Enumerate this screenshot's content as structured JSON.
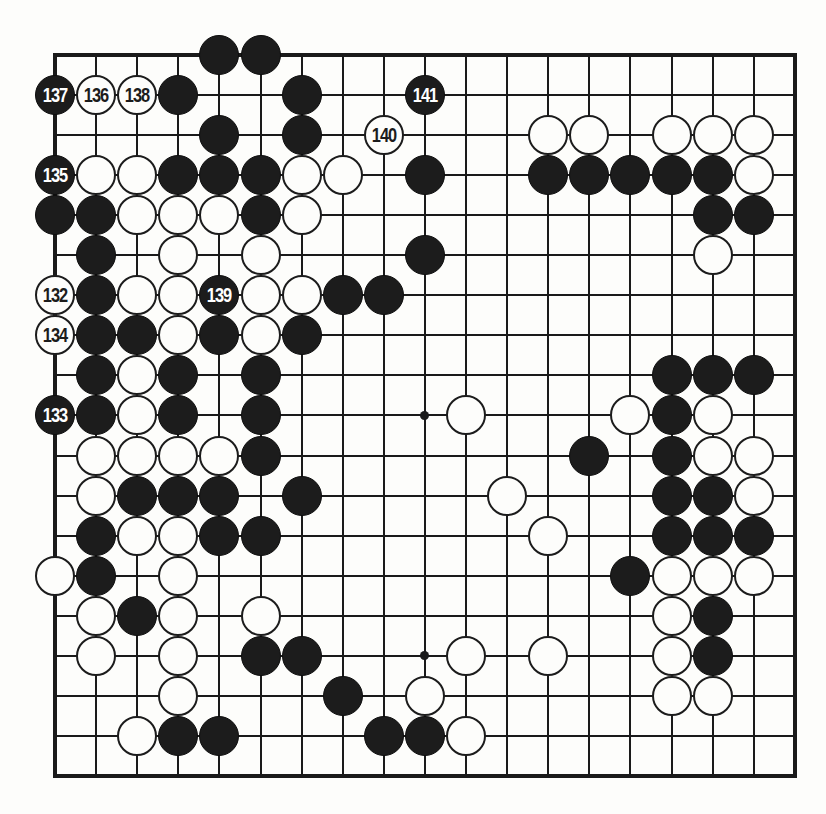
{
  "diagram": {
    "kind": "go-board-diagram",
    "board_size": 19,
    "colors": {
      "black": "#1c1c1c",
      "white": "#fdfdfb",
      "line": "#1a1a1a",
      "background": "#fdfdfb"
    },
    "geometry": {
      "origin_x": 55,
      "origin_y": 55,
      "pitch_x": 41.1,
      "pitch_y": 40.05,
      "stone_diameter": 40,
      "left": 55,
      "top": 55,
      "right": 795,
      "bottom": 776
    },
    "star_points": [
      {
        "col": 9,
        "row": 9
      },
      {
        "col": 9,
        "row": 15
      }
    ],
    "numbered_moves": [
      {
        "label": "137",
        "color": "black",
        "col": 0,
        "row": 1
      },
      {
        "label": "136",
        "color": "white",
        "col": 1,
        "row": 1
      },
      {
        "label": "138",
        "color": "white",
        "col": 2,
        "row": 1
      },
      {
        "label": "141",
        "color": "black",
        "col": 9,
        "row": 1
      },
      {
        "label": "140",
        "color": "white",
        "col": 8,
        "row": 2
      },
      {
        "label": "135",
        "color": "black",
        "col": 0,
        "row": 3
      },
      {
        "label": "132",
        "color": "white",
        "col": 0,
        "row": 6
      },
      {
        "label": "139",
        "color": "black",
        "col": 4,
        "row": 6
      },
      {
        "label": "134",
        "color": "white",
        "col": 0,
        "row": 7
      },
      {
        "label": "133",
        "color": "black",
        "col": 0,
        "row": 9
      }
    ],
    "stones": [
      {
        "color": "black",
        "col": 4,
        "row": 0
      },
      {
        "color": "black",
        "col": 5,
        "row": 0
      },
      {
        "color": "black",
        "col": 3,
        "row": 1
      },
      {
        "color": "black",
        "col": 6,
        "row": 1
      },
      {
        "color": "black",
        "col": 4,
        "row": 2
      },
      {
        "color": "black",
        "col": 6,
        "row": 2
      },
      {
        "color": "white",
        "col": 12,
        "row": 2
      },
      {
        "color": "white",
        "col": 13,
        "row": 2
      },
      {
        "color": "white",
        "col": 15,
        "row": 2
      },
      {
        "color": "white",
        "col": 16,
        "row": 2
      },
      {
        "color": "white",
        "col": 17,
        "row": 2
      },
      {
        "color": "white",
        "col": 1,
        "row": 3
      },
      {
        "color": "white",
        "col": 2,
        "row": 3
      },
      {
        "color": "black",
        "col": 3,
        "row": 3
      },
      {
        "color": "black",
        "col": 4,
        "row": 3
      },
      {
        "color": "black",
        "col": 5,
        "row": 3
      },
      {
        "color": "white",
        "col": 6,
        "row": 3
      },
      {
        "color": "white",
        "col": 7,
        "row": 3
      },
      {
        "color": "black",
        "col": 9,
        "row": 3
      },
      {
        "color": "black",
        "col": 12,
        "row": 3
      },
      {
        "color": "black",
        "col": 13,
        "row": 3
      },
      {
        "color": "black",
        "col": 14,
        "row": 3
      },
      {
        "color": "black",
        "col": 15,
        "row": 3
      },
      {
        "color": "black",
        "col": 16,
        "row": 3
      },
      {
        "color": "white",
        "col": 17,
        "row": 3
      },
      {
        "color": "black",
        "col": 0,
        "row": 4
      },
      {
        "color": "black",
        "col": 1,
        "row": 4
      },
      {
        "color": "white",
        "col": 2,
        "row": 4
      },
      {
        "color": "white",
        "col": 3,
        "row": 4
      },
      {
        "color": "white",
        "col": 4,
        "row": 4
      },
      {
        "color": "black",
        "col": 5,
        "row": 4
      },
      {
        "color": "white",
        "col": 6,
        "row": 4
      },
      {
        "color": "black",
        "col": 16,
        "row": 4
      },
      {
        "color": "black",
        "col": 17,
        "row": 4
      },
      {
        "color": "black",
        "col": 1,
        "row": 5
      },
      {
        "color": "white",
        "col": 3,
        "row": 5
      },
      {
        "color": "white",
        "col": 5,
        "row": 5
      },
      {
        "color": "black",
        "col": 9,
        "row": 5
      },
      {
        "color": "white",
        "col": 16,
        "row": 5
      },
      {
        "color": "black",
        "col": 1,
        "row": 6
      },
      {
        "color": "white",
        "col": 2,
        "row": 6
      },
      {
        "color": "white",
        "col": 3,
        "row": 6
      },
      {
        "color": "white",
        "col": 5,
        "row": 6
      },
      {
        "color": "white",
        "col": 6,
        "row": 6
      },
      {
        "color": "black",
        "col": 7,
        "row": 6
      },
      {
        "color": "black",
        "col": 8,
        "row": 6
      },
      {
        "color": "black",
        "col": 1,
        "row": 7
      },
      {
        "color": "black",
        "col": 2,
        "row": 7
      },
      {
        "color": "white",
        "col": 3,
        "row": 7
      },
      {
        "color": "black",
        "col": 4,
        "row": 7
      },
      {
        "color": "white",
        "col": 5,
        "row": 7
      },
      {
        "color": "black",
        "col": 6,
        "row": 7
      },
      {
        "color": "black",
        "col": 1,
        "row": 8
      },
      {
        "color": "white",
        "col": 2,
        "row": 8
      },
      {
        "color": "black",
        "col": 3,
        "row": 8
      },
      {
        "color": "black",
        "col": 5,
        "row": 8
      },
      {
        "color": "black",
        "col": 15,
        "row": 8
      },
      {
        "color": "black",
        "col": 16,
        "row": 8
      },
      {
        "color": "black",
        "col": 17,
        "row": 8
      },
      {
        "color": "black",
        "col": 1,
        "row": 9
      },
      {
        "color": "white",
        "col": 2,
        "row": 9
      },
      {
        "color": "black",
        "col": 3,
        "row": 9
      },
      {
        "color": "black",
        "col": 5,
        "row": 9
      },
      {
        "color": "white",
        "col": 10,
        "row": 9
      },
      {
        "color": "white",
        "col": 14,
        "row": 9
      },
      {
        "color": "black",
        "col": 15,
        "row": 9
      },
      {
        "color": "white",
        "col": 16,
        "row": 9
      },
      {
        "color": "white",
        "col": 1,
        "row": 10
      },
      {
        "color": "white",
        "col": 2,
        "row": 10
      },
      {
        "color": "white",
        "col": 3,
        "row": 10
      },
      {
        "color": "white",
        "col": 4,
        "row": 10
      },
      {
        "color": "black",
        "col": 5,
        "row": 10
      },
      {
        "color": "black",
        "col": 13,
        "row": 10
      },
      {
        "color": "black",
        "col": 15,
        "row": 10
      },
      {
        "color": "white",
        "col": 16,
        "row": 10
      },
      {
        "color": "white",
        "col": 17,
        "row": 10
      },
      {
        "color": "white",
        "col": 1,
        "row": 11
      },
      {
        "color": "black",
        "col": 2,
        "row": 11
      },
      {
        "color": "black",
        "col": 3,
        "row": 11
      },
      {
        "color": "black",
        "col": 4,
        "row": 11
      },
      {
        "color": "black",
        "col": 6,
        "row": 11
      },
      {
        "color": "white",
        "col": 11,
        "row": 11
      },
      {
        "color": "black",
        "col": 15,
        "row": 11
      },
      {
        "color": "black",
        "col": 16,
        "row": 11
      },
      {
        "color": "white",
        "col": 17,
        "row": 11
      },
      {
        "color": "black",
        "col": 1,
        "row": 12
      },
      {
        "color": "white",
        "col": 2,
        "row": 12
      },
      {
        "color": "white",
        "col": 3,
        "row": 12
      },
      {
        "color": "black",
        "col": 4,
        "row": 12
      },
      {
        "color": "black",
        "col": 5,
        "row": 12
      },
      {
        "color": "white",
        "col": 12,
        "row": 12
      },
      {
        "color": "black",
        "col": 15,
        "row": 12
      },
      {
        "color": "black",
        "col": 16,
        "row": 12
      },
      {
        "color": "black",
        "col": 17,
        "row": 12
      },
      {
        "color": "white",
        "col": 0,
        "row": 13
      },
      {
        "color": "black",
        "col": 1,
        "row": 13
      },
      {
        "color": "white",
        "col": 3,
        "row": 13
      },
      {
        "color": "black",
        "col": 14,
        "row": 13
      },
      {
        "color": "white",
        "col": 15,
        "row": 13
      },
      {
        "color": "white",
        "col": 16,
        "row": 13
      },
      {
        "color": "white",
        "col": 17,
        "row": 13
      },
      {
        "color": "white",
        "col": 1,
        "row": 14
      },
      {
        "color": "black",
        "col": 2,
        "row": 14
      },
      {
        "color": "white",
        "col": 3,
        "row": 14
      },
      {
        "color": "white",
        "col": 5,
        "row": 14
      },
      {
        "color": "white",
        "col": 15,
        "row": 14
      },
      {
        "color": "black",
        "col": 16,
        "row": 14
      },
      {
        "color": "white",
        "col": 1,
        "row": 15
      },
      {
        "color": "white",
        "col": 3,
        "row": 15
      },
      {
        "color": "black",
        "col": 5,
        "row": 15
      },
      {
        "color": "black",
        "col": 6,
        "row": 15
      },
      {
        "color": "white",
        "col": 10,
        "row": 15
      },
      {
        "color": "white",
        "col": 12,
        "row": 15
      },
      {
        "color": "white",
        "col": 15,
        "row": 15
      },
      {
        "color": "black",
        "col": 16,
        "row": 15
      },
      {
        "color": "white",
        "col": 3,
        "row": 16
      },
      {
        "color": "black",
        "col": 7,
        "row": 16
      },
      {
        "color": "white",
        "col": 9,
        "row": 16
      },
      {
        "color": "white",
        "col": 15,
        "row": 16
      },
      {
        "color": "white",
        "col": 16,
        "row": 16
      },
      {
        "color": "white",
        "col": 2,
        "row": 17
      },
      {
        "color": "black",
        "col": 3,
        "row": 17
      },
      {
        "color": "black",
        "col": 4,
        "row": 17
      },
      {
        "color": "black",
        "col": 8,
        "row": 17
      },
      {
        "color": "black",
        "col": 9,
        "row": 17
      },
      {
        "color": "white",
        "col": 10,
        "row": 17
      }
    ]
  }
}
